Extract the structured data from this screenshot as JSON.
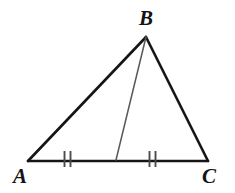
{
  "figure": {
    "kind": "geometry-diagram",
    "background_color": "#ffffff",
    "width": 235,
    "height": 193,
    "labels": {
      "a": "A",
      "b": "B",
      "c": "C"
    },
    "vertices": [
      {
        "name": "A",
        "x": 28,
        "y": 161
      },
      {
        "name": "B",
        "x": 146,
        "y": 37
      },
      {
        "name": "C",
        "x": 208,
        "y": 161
      }
    ],
    "midpoint": {
      "name": "D",
      "x": 116,
      "y": 160
    },
    "segments": [
      {
        "name": "side-AB",
        "from": "A",
        "to": "B",
        "color": "#151515",
        "width": 2.6
      },
      {
        "name": "side-BC",
        "from": "B",
        "to": "C",
        "color": "#151515",
        "width": 2.6
      },
      {
        "name": "side-AC",
        "from": "A",
        "to": "C",
        "color": "#151515",
        "width": 2.6
      },
      {
        "name": "median-BD",
        "from": "B",
        "to": "D",
        "color": "#58585a",
        "width": 1.5
      }
    ],
    "tick_marks": {
      "color": "#4a4a4c",
      "width": 1.9,
      "top_y": 151,
      "bottom_y": 167,
      "groups": [
        {
          "name": "tick-group-AD",
          "count": 2,
          "x_positions": [
            64.5,
            70.5
          ]
        },
        {
          "name": "tick-group-DC",
          "count": 2,
          "x_positions": [
            149.5,
            155.5
          ]
        }
      ]
    }
  }
}
